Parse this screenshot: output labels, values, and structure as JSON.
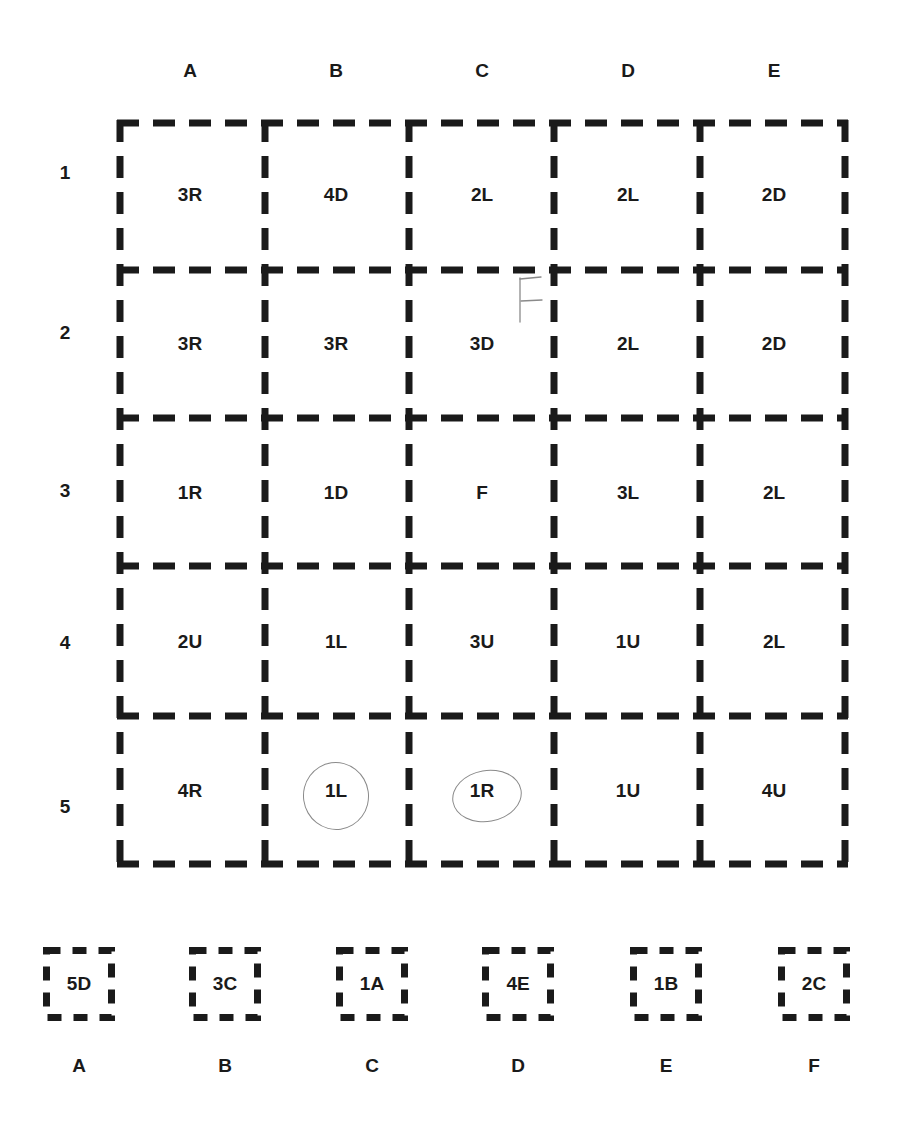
{
  "columns": [
    "A",
    "B",
    "C",
    "D",
    "E"
  ],
  "rows": [
    "1",
    "2",
    "3",
    "4",
    "5"
  ],
  "grid": [
    [
      "3R",
      "4D",
      "2L",
      "2L",
      "2D"
    ],
    [
      "3R",
      "3R",
      "3D",
      "2L",
      "2D"
    ],
    [
      "1R",
      "1D",
      "F",
      "3L",
      "2L"
    ],
    [
      "2U",
      "1L",
      "3U",
      "1U",
      "2L"
    ],
    [
      "4R",
      "1L",
      "1R",
      "1U",
      "4U"
    ]
  ],
  "annotations": {
    "pencil_letter": "F",
    "circled_cells": [
      "5B",
      "5C"
    ]
  },
  "options": [
    {
      "value": "5D",
      "label": "A"
    },
    {
      "value": "3C",
      "label": "B"
    },
    {
      "value": "1A",
      "label": "C"
    },
    {
      "value": "4E",
      "label": "D"
    },
    {
      "value": "1B",
      "label": "E"
    },
    {
      "value": "2C",
      "label": "F"
    }
  ],
  "colors": {
    "ink": "#1a1a1a",
    "pencil": "#8a8a8a",
    "background": "#ffffff"
  }
}
